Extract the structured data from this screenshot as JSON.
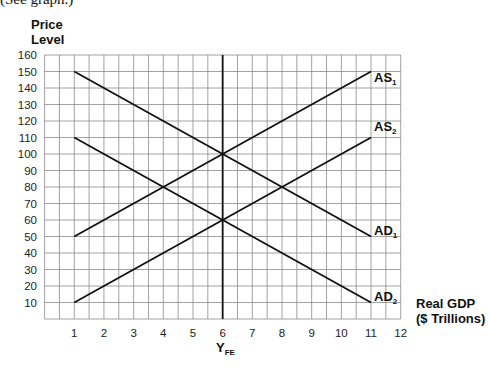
{
  "caption": "(See graph.)",
  "axes": {
    "ylabel_line1": "Price",
    "ylabel_line2": "Level",
    "xlabel_line1": "Real GDP",
    "xlabel_line2": "($ Trillions)",
    "yfe_label": "Y",
    "yfe_sub": "FE"
  },
  "curve_labels": {
    "as1": "AS",
    "as1_sub": "1",
    "as2": "AS",
    "as2_sub": "2",
    "ad1": "AD",
    "ad1_sub": "1",
    "ad2": "AD",
    "ad2_sub": "2"
  },
  "chart_data": {
    "type": "line",
    "title": "",
    "xlabel": "Real GDP ($ Trillions)",
    "ylabel": "Price Level",
    "xlim": [
      0,
      12
    ],
    "ylim": [
      0,
      160
    ],
    "x_ticks": [
      1,
      2,
      3,
      4,
      5,
      6,
      7,
      8,
      9,
      10,
      11,
      12
    ],
    "y_ticks": [
      10,
      20,
      30,
      40,
      50,
      60,
      70,
      80,
      90,
      100,
      110,
      120,
      130,
      140,
      150,
      160
    ],
    "grid": true,
    "grid_x_step": 0.5,
    "grid_y_step": 10,
    "series": [
      {
        "name": "AS1",
        "x": [
          1,
          11
        ],
        "y": [
          50,
          150
        ]
      },
      {
        "name": "AS2",
        "x": [
          1,
          11
        ],
        "y": [
          10,
          110
        ]
      },
      {
        "name": "AD1",
        "x": [
          1,
          11
        ],
        "y": [
          150,
          50
        ]
      },
      {
        "name": "AD2",
        "x": [
          1,
          11
        ],
        "y": [
          110,
          10
        ]
      }
    ],
    "vertical_lines": [
      {
        "name": "YFE",
        "x": 6
      }
    ],
    "intersections": [
      {
        "curves": [
          "AS1",
          "AD1"
        ],
        "x": 6,
        "y": 100
      },
      {
        "curves": [
          "AS2",
          "AD2"
        ],
        "x": 6,
        "y": 60
      },
      {
        "curves": [
          "AS1",
          "AD2"
        ],
        "x": 4,
        "y": 80
      },
      {
        "curves": [
          "AS2",
          "AD1"
        ],
        "x": 8,
        "y": 80
      }
    ]
  }
}
